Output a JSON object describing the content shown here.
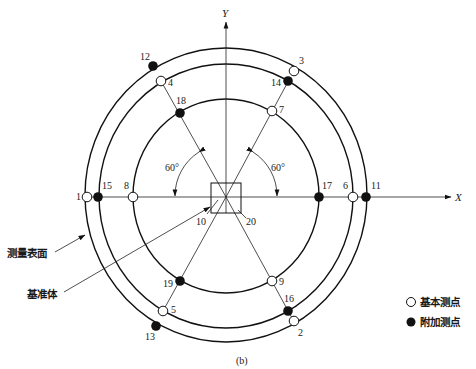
{
  "figure": {
    "caption": "(b)",
    "axes": {
      "x_label": "X",
      "y_label": "Y"
    },
    "angle_labels": [
      "60°",
      "60°"
    ],
    "callouts": {
      "measuring_surface": "测量表面",
      "reference_body": "基准体"
    },
    "legend": [
      {
        "symbol": "open-circle",
        "label": "基本测点"
      },
      {
        "symbol": "filled-circle",
        "label": "附加测点"
      }
    ],
    "center_labels": {
      "left": "10",
      "right": "20"
    },
    "rings": [
      {
        "name": "outer",
        "rx": 141,
        "ry": 147
      },
      {
        "name": "middle",
        "rx": 127,
        "ry": 132
      },
      {
        "name": "inner",
        "rx": 93,
        "ry": 97
      }
    ],
    "points": [
      {
        "id": "1",
        "type": "basic",
        "x": 87,
        "y": 197,
        "lx": 76,
        "ly": 200
      },
      {
        "id": "15",
        "type": "additional",
        "x": 98,
        "y": 197,
        "lx": 102,
        "ly": 189
      },
      {
        "id": "8",
        "type": "basic",
        "x": 133,
        "y": 197,
        "lx": 124,
        "ly": 189
      },
      {
        "id": "17",
        "type": "additional",
        "x": 319,
        "y": 197,
        "lx": 322,
        "ly": 189
      },
      {
        "id": "6",
        "type": "basic",
        "x": 353,
        "y": 197,
        "lx": 343,
        "ly": 189
      },
      {
        "id": "11",
        "type": "additional",
        "x": 366,
        "y": 197,
        "lx": 371,
        "ly": 189
      },
      {
        "id": "12",
        "type": "additional",
        "x": 153,
        "y": 66,
        "lx": 140,
        "ly": 60
      },
      {
        "id": "4",
        "type": "basic",
        "x": 161,
        "y": 81,
        "lx": 168,
        "ly": 86
      },
      {
        "id": "18",
        "type": "additional",
        "x": 180,
        "y": 113,
        "lx": 176,
        "ly": 104
      },
      {
        "id": "3",
        "type": "basic",
        "x": 294,
        "y": 71,
        "lx": 299,
        "ly": 64
      },
      {
        "id": "14",
        "type": "additional",
        "x": 288,
        "y": 81,
        "lx": 271,
        "ly": 86
      },
      {
        "id": "7",
        "type": "basic",
        "x": 272,
        "y": 111,
        "lx": 279,
        "ly": 113
      },
      {
        "id": "19",
        "type": "additional",
        "x": 180,
        "y": 281,
        "lx": 163,
        "ly": 287
      },
      {
        "id": "5",
        "type": "basic",
        "x": 163,
        "y": 311,
        "lx": 171,
        "ly": 313
      },
      {
        "id": "13",
        "type": "additional",
        "x": 156,
        "y": 326,
        "lx": 145,
        "ly": 340
      },
      {
        "id": "9",
        "type": "basic",
        "x": 272,
        "y": 281,
        "lx": 279,
        "ly": 285
      },
      {
        "id": "16",
        "type": "additional",
        "x": 288,
        "y": 311,
        "lx": 284,
        "ly": 302
      },
      {
        "id": "2",
        "type": "basic",
        "x": 294,
        "y": 321,
        "lx": 298,
        "ly": 336
      }
    ]
  }
}
